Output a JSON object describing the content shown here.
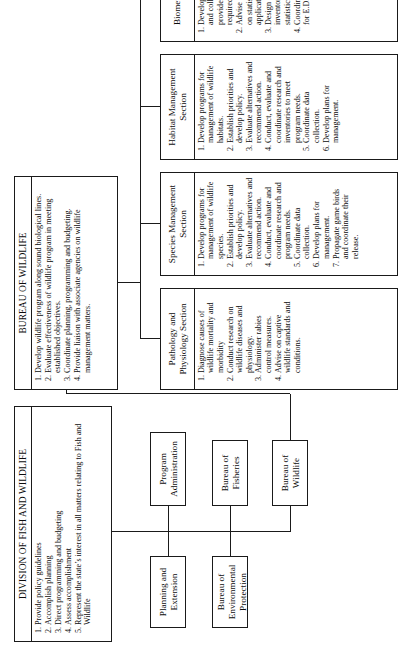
{
  "chart": {
    "type": "org-chart",
    "orientation": "rotated-90-ccw"
  },
  "division": {
    "title": "DIVISION OF FISH AND WILDLIFE",
    "items": [
      "Provide policy guidelines",
      "Accomplish planning",
      "Direct programming and budgeting",
      "Assess accomplishment",
      "Represent the state’s interest in all matters relating to Fish and Wildlife"
    ]
  },
  "staff": {
    "planning_and_extension": "Planning and Extension",
    "program_administration": "Program Administration"
  },
  "bureaus": {
    "environmental_protection": "Bureau of Environmental Protection",
    "fisheries": "Bureau of Fisheries",
    "wildlife": "Bureau of Wildlife"
  },
  "bureau_of_wildlife": {
    "title": "BUREAU OF WILDLIFE",
    "items": [
      "Develop wildlife program along sound biological lines.",
      "Evaluate effectiveness of wildlife program in meeting established objectives.",
      "Coordinate planning, programming and budgeting.",
      "Provide liaison with associate agencies on wildlife management matters."
    ]
  },
  "sections": [
    {
      "name": "Pathology and Physiology Section",
      "items": [
        "Diagnose causes of wildlife mortality and morbidity",
        "Conduct research on wildlife diseases and physiology.",
        "Administer rabies control measures.",
        "Advise on captive wildlife standards and conditions."
      ]
    },
    {
      "name": "Species Management Section",
      "items": [
        "Develop programs for management of wildlife species.",
        "Establish priorities and develop policy.",
        "Evaluate alternatives and recommend action.",
        "Conduct, evaluate and coordinate research and program needs.",
        "Coordinate data collection.",
        "Develop plans for management.",
        "Propagate game birds and coordinate their release."
      ]
    },
    {
      "name": "Habitat Management Section",
      "items": [
        "Develop programs for management of wildlife habitats.",
        "Establish priorities and develop policy.",
        "Evaluate alternatives and recommend action.",
        "Conduct, evaluate and coordinate research and inventories to meet program needs.",
        "Coordinate data collection.",
        "Develop plans for management."
      ]
    },
    {
      "name": "Biometrics Section",
      "items": [
        "Develop data systems and collect, receive and provide information as required.",
        "Advise staff specialists on statistical needs and application.",
        "Design surveys and inventories along sound statistical lines.",
        "Coordinate staff needs for E.D.P."
      ]
    }
  ]
}
